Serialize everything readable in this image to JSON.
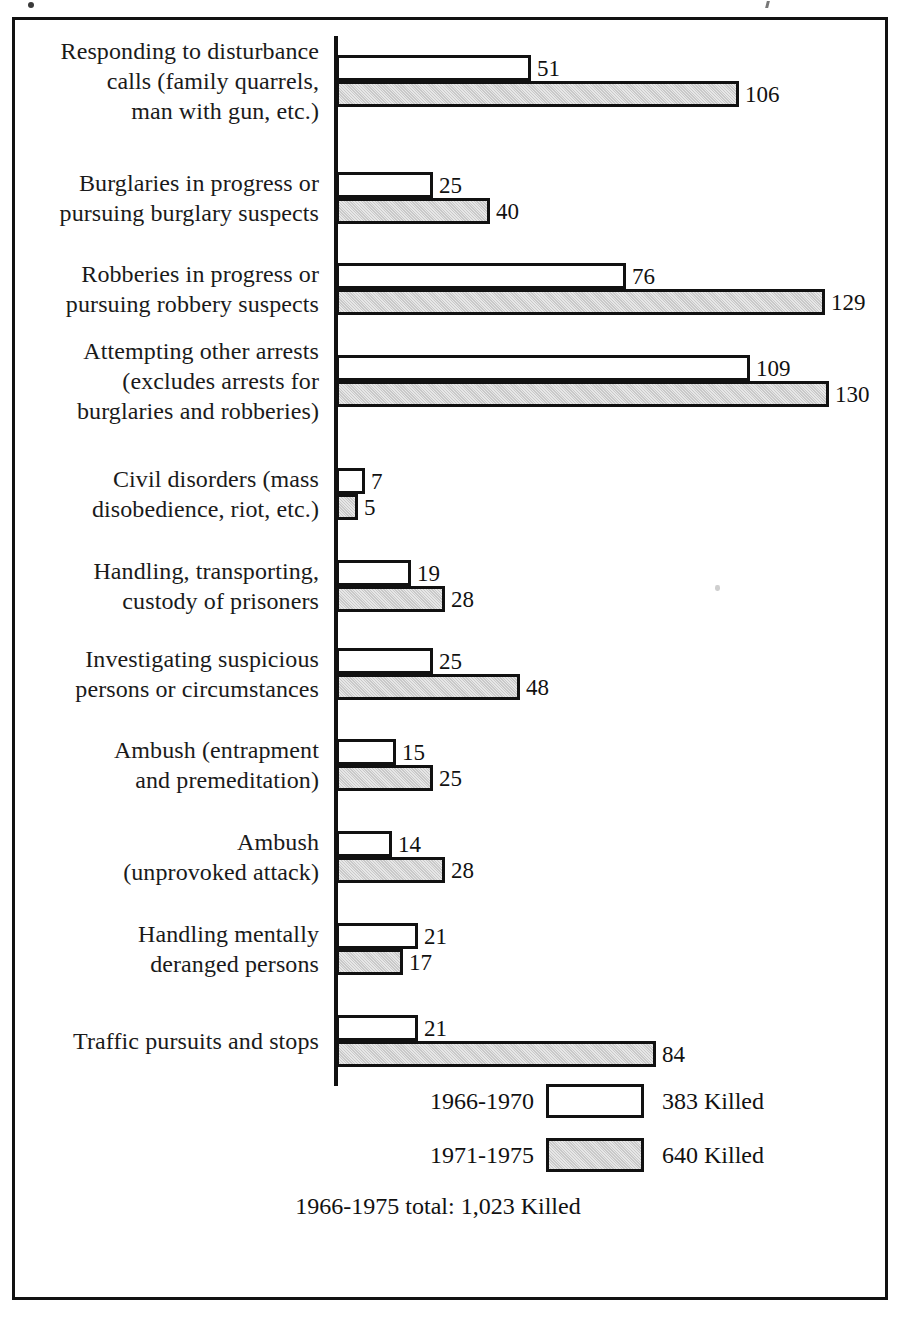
{
  "chart_data": {
    "type": "bar",
    "orientation": "horizontal",
    "title": "",
    "xlabel": "",
    "ylabel": "",
    "grid": false,
    "legend_position": "bottom",
    "px_per_unit": 3.77,
    "categories": [
      "Responding to disturbance calls (family quarrels, man with gun, etc.)",
      "Burglaries in progress or pursuing burglary suspects",
      "Robberies in progress or pursuing robbery suspects",
      "Attempting other arrests (excludes arrests for burglaries and robberies)",
      "Civil disorders (mass disobedience, riot, etc.)",
      "Handling, transporting, custody of prisoners",
      "Investigating suspicious persons or circumstances",
      "Ambush (entrapment and premeditation)",
      "Ambush (unprovoked attack)",
      "Handling mentally deranged persons",
      "Traffic pursuits and stops"
    ],
    "series": [
      {
        "name": "1966-1970",
        "values": [
          51,
          25,
          76,
          109,
          7,
          19,
          25,
          15,
          14,
          21,
          21
        ]
      },
      {
        "name": "1971-1975",
        "values": [
          106,
          40,
          129,
          130,
          5,
          28,
          48,
          25,
          28,
          17,
          84
        ]
      }
    ]
  },
  "rows": [
    {
      "label_lines": [
        "Responding to disturbance",
        "calls (family quarrels,",
        "man with gun, etc.)"
      ],
      "p1": 51,
      "p2": 106,
      "p1_text": "51",
      "p2_text": "106"
    },
    {
      "label_lines": [
        "Burglaries in progress or",
        "pursuing burglary suspects"
      ],
      "p1": 25,
      "p2": 40,
      "p1_text": "25",
      "p2_text": "40"
    },
    {
      "label_lines": [
        "Robberies in progress or",
        "pursuing robbery suspects"
      ],
      "p1": 76,
      "p2": 129,
      "p1_text": "76",
      "p2_text": "129"
    },
    {
      "label_lines": [
        "Attempting other arrests",
        "(excludes arrests for",
        "burglaries and robberies)"
      ],
      "p1": 109,
      "p2": 130,
      "p1_text": "109",
      "p2_text": "130"
    },
    {
      "label_lines": [
        "Civil disorders (mass",
        "disobedience, riot, etc.)"
      ],
      "p1": 7,
      "p2": 5,
      "p1_text": "7",
      "p2_text": "5"
    },
    {
      "label_lines": [
        "Handling, transporting,",
        "custody of prisoners"
      ],
      "p1": 19,
      "p2": 28,
      "p1_text": "19",
      "p2_text": "28"
    },
    {
      "label_lines": [
        "Investigating suspicious",
        "persons or circumstances"
      ],
      "p1": 25,
      "p2": 48,
      "p1_text": "25",
      "p2_text": "48"
    },
    {
      "label_lines": [
        "Ambush (entrapment",
        "and premeditation)"
      ],
      "p1": 15,
      "p2": 25,
      "p1_text": "15",
      "p2_text": "25"
    },
    {
      "label_lines": [
        "Ambush",
        "(unprovoked attack)"
      ],
      "p1": 14,
      "p2": 28,
      "p1_text": "14",
      "p2_text": "28"
    },
    {
      "label_lines": [
        "Handling mentally",
        "deranged persons"
      ],
      "p1": 21,
      "p2": 17,
      "p1_text": "21",
      "p2_text": "17"
    },
    {
      "label_lines": [
        "Traffic pursuits and stops"
      ],
      "p1": 21,
      "p2": 84,
      "p1_text": "21",
      "p2_text": "84"
    }
  ],
  "legend": {
    "entries": [
      {
        "period": "1966-1970",
        "swatch": "white",
        "count": "383 Killed"
      },
      {
        "period": "1971-1975",
        "swatch": "gray",
        "count": "640 Killed"
      }
    ],
    "total": "1966-1975 total: 1,023 Killed"
  },
  "colors": {
    "ink": "#111111",
    "bar_period1_fill": "#ffffff",
    "bar_period2_fill": "#c9c9c9",
    "frame": "#111111",
    "background": "#ffffff"
  }
}
